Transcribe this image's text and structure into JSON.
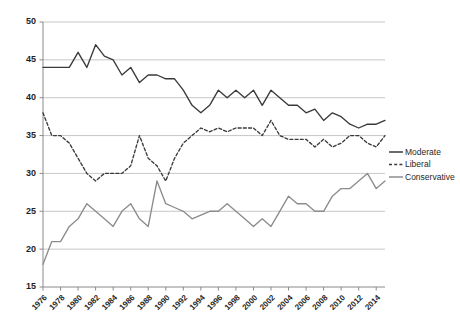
{
  "chart_data": {
    "type": "line",
    "title": "",
    "subtitle": "",
    "xlabel": "",
    "ylabel": "",
    "xlim": [
      1976,
      2015
    ],
    "ylim": [
      15,
      50
    ],
    "yticks": [
      15,
      20,
      25,
      30,
      35,
      40,
      45,
      50
    ],
    "xticks": [
      1976,
      1978,
      1980,
      1982,
      1984,
      1986,
      1988,
      1990,
      1992,
      1994,
      1996,
      1998,
      2000,
      2002,
      2004,
      2006,
      2008,
      2010,
      2012,
      2014
    ],
    "grid": "horizontal",
    "legend_position": "right",
    "x": [
      1976,
      1977,
      1978,
      1979,
      1980,
      1981,
      1982,
      1983,
      1984,
      1985,
      1986,
      1987,
      1988,
      1989,
      1990,
      1991,
      1992,
      1993,
      1994,
      1995,
      1996,
      1997,
      1998,
      1999,
      2000,
      2001,
      2002,
      2003,
      2004,
      2005,
      2006,
      2007,
      2008,
      2009,
      2010,
      2011,
      2012,
      2013,
      2014,
      2015
    ],
    "series": [
      {
        "name": "Moderate",
        "style": "solid",
        "color": "#3a3a3a",
        "values": [
          44,
          44,
          44,
          44,
          46,
          44,
          47,
          45.5,
          45,
          43,
          44,
          42,
          43,
          43,
          42.5,
          42.5,
          41,
          39,
          38,
          39,
          41,
          40,
          41,
          40,
          41,
          39,
          41,
          40,
          39,
          39,
          38,
          38.5,
          37,
          38,
          37.5,
          36.5,
          36,
          36.5,
          36.5,
          37
        ]
      },
      {
        "name": "Liberal",
        "style": "dashed",
        "color": "#3a3a3a",
        "values": [
          38,
          35,
          35,
          34,
          32,
          30,
          29,
          30,
          30,
          30,
          31,
          35,
          32,
          31,
          29,
          32,
          34,
          35,
          36,
          35.5,
          36,
          35.5,
          36,
          36,
          36,
          35,
          37,
          35,
          34.5,
          34.5,
          34.5,
          33.5,
          34.5,
          33.5,
          34,
          35,
          35,
          34,
          33.5,
          35
        ]
      },
      {
        "name": "Conservative",
        "style": "solid",
        "color": "#8c8c8c",
        "values": [
          18,
          21,
          21,
          23,
          24,
          26,
          25,
          24,
          23,
          25,
          26,
          24,
          23,
          29,
          26,
          25.5,
          25,
          24,
          24.5,
          25,
          25,
          26,
          25,
          24,
          23,
          24,
          23,
          25,
          27,
          26,
          26,
          25,
          25,
          27,
          28,
          28,
          29,
          30,
          28,
          29
        ]
      }
    ]
  },
  "legend": {
    "items": [
      {
        "label": "Moderate"
      },
      {
        "label": "Liberal"
      },
      {
        "label": "Conservative"
      }
    ]
  }
}
